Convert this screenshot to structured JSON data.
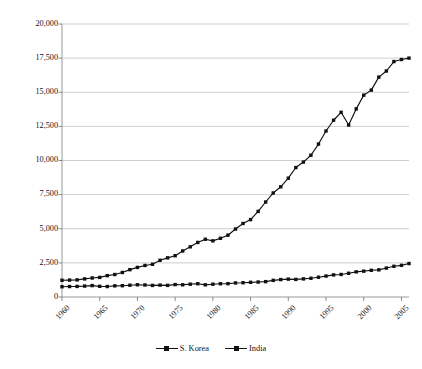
{
  "chart_data": {
    "type": "line",
    "title": "",
    "xlabel": "",
    "ylabel": "Per Capita GDP in 1990 Int'l. Geary-Khamis dollars",
    "xlim": [
      1960,
      2006
    ],
    "ylim": [
      0,
      20000
    ],
    "grid": true,
    "legend_position": "bottom",
    "x_tick_labels": [
      "1960",
      "1965",
      "1970",
      "1975",
      "1980",
      "1985",
      "1990",
      "1995",
      "2000",
      "2005"
    ],
    "x_tick_values": [
      1960,
      1965,
      1970,
      1975,
      1980,
      1985,
      1990,
      1995,
      2000,
      2005
    ],
    "y_tick_labels": [
      "0",
      "2,500",
      "5,000",
      "7,500",
      "10,000",
      "12,500",
      "15,000",
      "17,500",
      "20,000"
    ],
    "y_tick_values": [
      0,
      2500,
      5000,
      7500,
      10000,
      12500,
      15000,
      17500,
      20000
    ],
    "x": [
      1960,
      1961,
      1962,
      1963,
      1964,
      1965,
      1966,
      1967,
      1968,
      1969,
      1970,
      1971,
      1972,
      1973,
      1974,
      1975,
      1976,
      1977,
      1978,
      1979,
      1980,
      1981,
      1982,
      1983,
      1984,
      1985,
      1986,
      1987,
      1988,
      1989,
      1990,
      1991,
      1992,
      1993,
      1994,
      1995,
      1996,
      1997,
      1998,
      1999,
      2000,
      2001,
      2002,
      2003,
      2004,
      2005,
      2006
    ],
    "series": [
      {
        "name": "S. Korea",
        "color": "#111111",
        "marker": "square",
        "values": [
          1226,
          1238,
          1254,
          1325,
          1392,
          1436,
          1564,
          1646,
          1797,
          2003,
          2167,
          2311,
          2398,
          2691,
          2868,
          3025,
          3372,
          3676,
          3996,
          4230,
          4114,
          4302,
          4529,
          4979,
          5386,
          5670,
          6270,
          6960,
          7621,
          8073,
          8704,
          9484,
          9886,
          10387,
          11204,
          12160,
          12950,
          13530,
          12600,
          13781,
          14784,
          15157,
          16109,
          16556,
          17248,
          17400,
          17500
        ]
      },
      {
        "name": "India",
        "color": "#111111",
        "marker": "square",
        "values": [
          753,
          767,
          776,
          800,
          837,
          783,
          768,
          816,
          827,
          863,
          896,
          880,
          849,
          869,
          853,
          910,
          894,
          939,
          973,
          892,
          938,
          972,
          977,
          1029,
          1046,
          1076,
          1096,
          1125,
          1219,
          1276,
          1309,
          1288,
          1327,
          1372,
          1449,
          1534,
          1619,
          1651,
          1739,
          1842,
          1892,
          1957,
          1988,
          2120,
          2250,
          2320,
          2450
        ]
      }
    ],
    "annotations": []
  },
  "legend": {
    "entries": [
      {
        "label": "S. Korea"
      },
      {
        "label": "India"
      }
    ]
  }
}
